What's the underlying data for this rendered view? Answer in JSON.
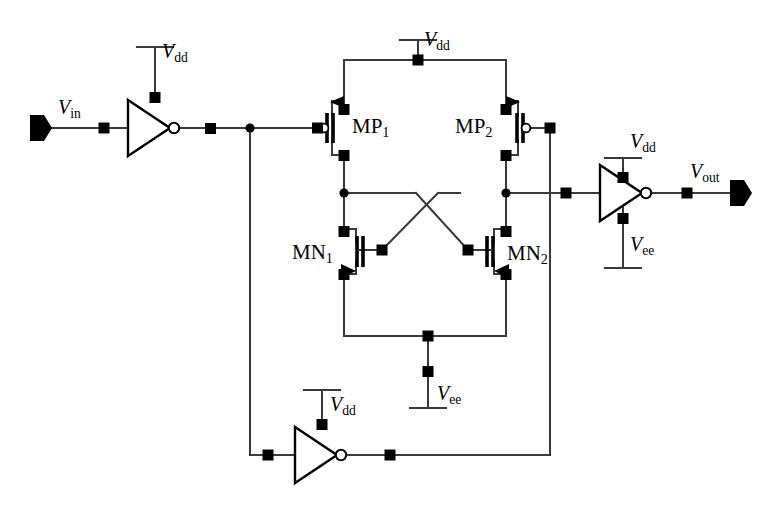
{
  "diagram": {
    "colors": {
      "line": "#3a3a3a",
      "node": "#000000",
      "background": "#ffffff"
    },
    "ports": [
      {
        "name": "input-port",
        "label_v": "V",
        "label_sub": "in",
        "x": 58,
        "y": 112
      },
      {
        "name": "output-port",
        "label_v": "V",
        "label_sub": "out",
        "x": 700,
        "y": 175
      }
    ],
    "devices": [
      {
        "name": "mp1",
        "label_main": "MP",
        "label_sub": "1",
        "type": "pmos",
        "x": 355,
        "y": 118
      },
      {
        "name": "mp2",
        "label_main": "MP",
        "label_sub": "2",
        "type": "pmos",
        "x": 458,
        "y": 118
      },
      {
        "name": "mn1",
        "label_main": "MN",
        "label_sub": "1",
        "type": "nmos",
        "x": 322,
        "y": 252
      },
      {
        "name": "mn2",
        "label_main": "MN",
        "label_sub": "2",
        "type": "nmos",
        "x": 510,
        "y": 253
      }
    ],
    "supplies": [
      {
        "name": "vdd-input-inverter",
        "label_v": "V",
        "label_sub": "dd",
        "kind": "vdd",
        "x": 166,
        "y": 32
      },
      {
        "name": "vdd-main-rail",
        "label_v": "V",
        "label_sub": "dd",
        "kind": "vdd",
        "x": 418,
        "y": 24
      },
      {
        "name": "vdd-output-inverter",
        "label_v": "V",
        "label_sub": "dd",
        "kind": "vdd",
        "x": 632,
        "y": 123
      },
      {
        "name": "vee-output-inverter",
        "label_v": "V",
        "label_sub": "ee",
        "kind": "vee",
        "x": 632,
        "y": 233
      },
      {
        "name": "vee-tail",
        "label_v": "V",
        "label_sub": "ee",
        "kind": "vee",
        "x": 443,
        "y": 391
      },
      {
        "name": "vdd-feedback-inverter",
        "label_v": "V",
        "label_sub": "dd",
        "kind": "vdd",
        "x": 333,
        "y": 389
      }
    ],
    "inverters": [
      {
        "name": "input-inverter",
        "x": 128,
        "y": 128
      },
      {
        "name": "output-inverter",
        "x": 600,
        "y": 192
      },
      {
        "name": "feedback-inverter",
        "x": 295,
        "y": 455
      }
    ]
  }
}
